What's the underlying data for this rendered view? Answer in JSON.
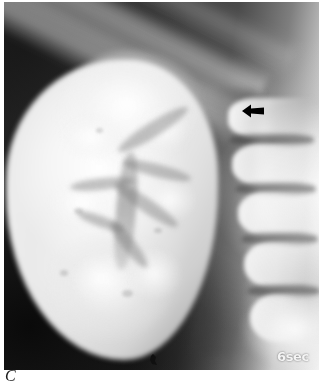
{
  "figure": {
    "panel_label": "C",
    "modality": "radiograph",
    "study": "intravenous-urogram",
    "phase": "nephrogram"
  },
  "radiograph": {
    "timing_label": "6sec",
    "annotations": [
      {
        "name": "pointer-arrow",
        "icon": "arrow-left-icon",
        "direction": "left",
        "color": "#000000",
        "x": 238,
        "y": 101,
        "width": 22,
        "height": 16
      },
      {
        "name": "inferior-marker",
        "icon": "radiopaque-marker-icon",
        "color": "#101010",
        "x": 144,
        "y": 352,
        "width": 13,
        "height": 12
      }
    ],
    "structures": [
      {
        "name": "kidney-nephrogram",
        "region": "left-center",
        "density": "bright"
      },
      {
        "name": "renal-pelvis",
        "region": "center",
        "density": "intermediate"
      },
      {
        "name": "calyces",
        "region": "center",
        "density": "intermediate"
      },
      {
        "name": "rib-band",
        "region": "top-diagonal",
        "density": "bright"
      },
      {
        "name": "vertebral-column",
        "region": "right",
        "density": "bright"
      },
      {
        "name": "psoas-shadow",
        "region": "mid-right",
        "density": "dark"
      }
    ]
  },
  "colors": {
    "film_dark": "#1a1a1a",
    "film_mid": "#4a4a4a",
    "film_bright": "#f2f2f2",
    "annotation": "#000000",
    "label_text": "#f4f4f4",
    "page_background": "#ffffff",
    "caption_text": "#1a1a1a"
  }
}
